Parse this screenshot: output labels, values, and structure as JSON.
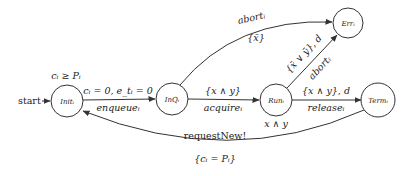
{
  "diagram": {
    "type": "timed-automaton",
    "start_label": "start",
    "states": [
      {
        "id": "init",
        "label": "Init_i",
        "invariant": "c_i ≥ P_i"
      },
      {
        "id": "inq",
        "label": "InQ_i"
      },
      {
        "id": "run",
        "label": "Run_i",
        "invariant": "x ∧ y"
      },
      {
        "id": "term",
        "label": "Term_i"
      },
      {
        "id": "err",
        "label": "Err_i"
      }
    ],
    "state_labels": {
      "init": "Initᵢ",
      "inq": "InQᵢ",
      "run": "Runᵢ",
      "term": "Termᵢ",
      "err": "Errᵢ"
    },
    "init_invariant": "cᵢ ≥ Pᵢ",
    "run_invariant": "x ∧ y",
    "edges": {
      "init_to_inq": {
        "top": "cᵢ = 0, e_tᵢ = 0",
        "bottom": "enqueueᵢ"
      },
      "inq_to_run": {
        "top": "{x ∧ y}",
        "bottom": "acquireᵢ"
      },
      "run_to_term": {
        "top": "{x ∧ y}, d",
        "bottom": "releaseᵢ"
      },
      "inq_to_err": {
        "top": "abortᵢ",
        "bottom": "{x̄}"
      },
      "run_to_err": {
        "top": "{x̄ ∨ ȳ}, d",
        "bottom": "abortᵢ"
      },
      "term_to_init": {
        "top": "requestNew!",
        "bottom": "{cᵢ = Pᵢ}"
      }
    }
  }
}
